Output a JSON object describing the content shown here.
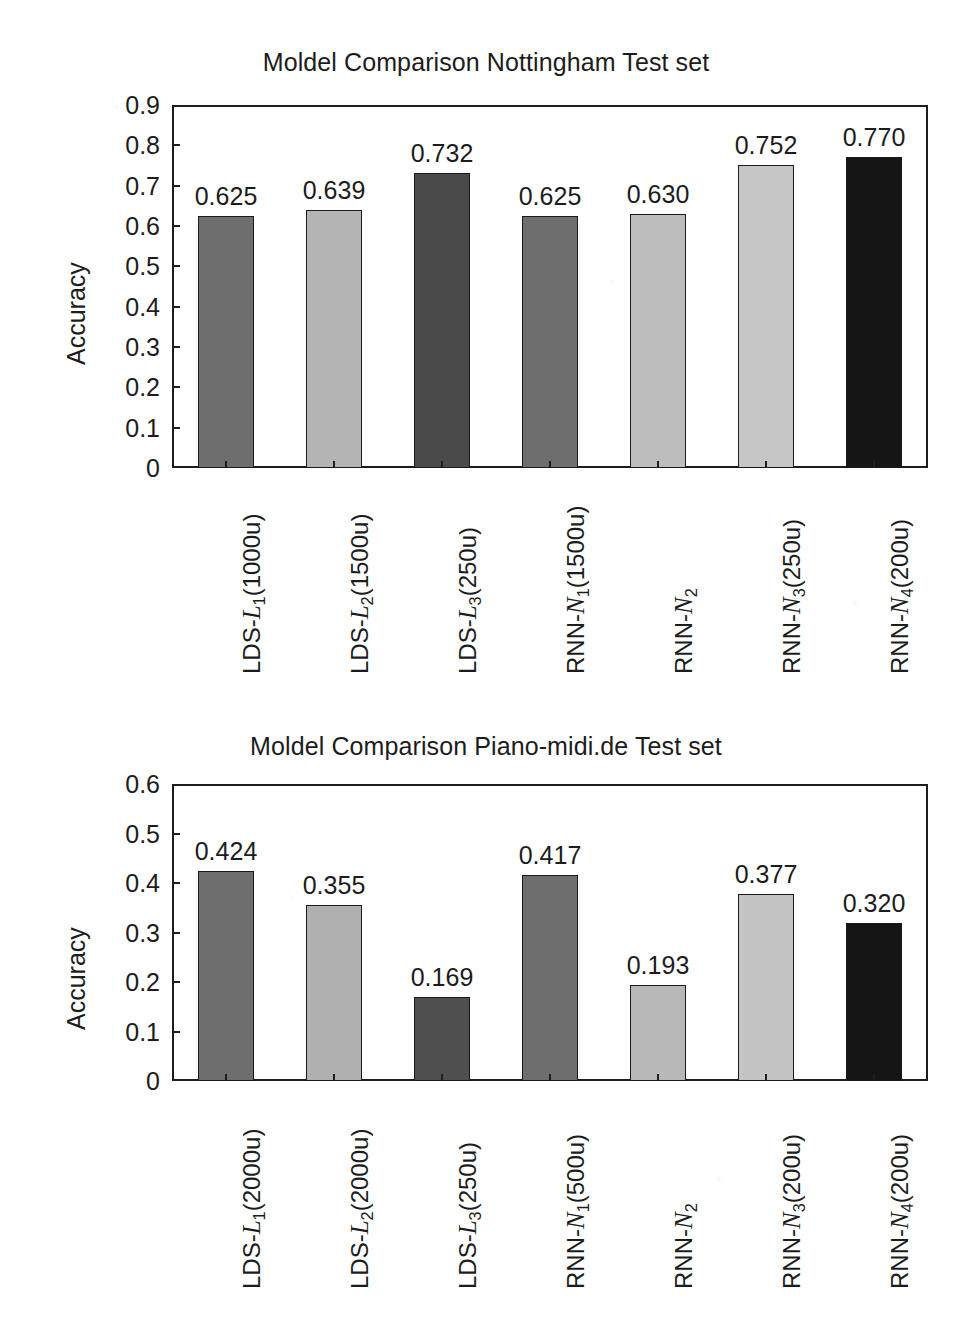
{
  "page": {
    "background_color": "#ffffff",
    "ink_color": "#1c1c1c"
  },
  "figures": [
    {
      "id": "nottingham",
      "title": "Moldel Comparison Nottingham Test set",
      "ylabel": "Accuracy"
    },
    {
      "id": "pianomidi",
      "title": "Moldel Comparison Piano-midi.de Test set",
      "ylabel": "Accuracy"
    }
  ],
  "chart_data": [
    {
      "type": "bar",
      "title": "Moldel Comparison Nottingham Test set",
      "xlabel": "",
      "ylabel": "Accuracy",
      "ylim": [
        0,
        0.9
      ],
      "grid": false,
      "legend": "none",
      "ytick_labels": [
        "0.9",
        "0.8",
        "0.7",
        "0.6",
        "0.5",
        "0.4",
        "0.3",
        "0.2",
        "0.1",
        "0"
      ],
      "ytick_values": [
        0.9,
        0.8,
        0.7,
        0.6,
        0.5,
        0.4,
        0.3,
        0.2,
        0.1,
        0
      ],
      "categories": [
        "LDS-L1(1000u)",
        "LDS-L2(1500u)",
        "LDS-L3(250u)",
        "RNN-N1(1500u)",
        "RNN-N2",
        "RNN-N3(250u)",
        "RNN-N4(200u)"
      ],
      "category_parts": [
        {
          "prefix": "LDS-",
          "symbol": "L",
          "sub": "1",
          "suffix": "(1000u)"
        },
        {
          "prefix": "LDS-",
          "symbol": "L",
          "sub": "2",
          "suffix": "(1500u)"
        },
        {
          "prefix": "LDS-",
          "symbol": "L",
          "sub": "3",
          "suffix": "(250u)"
        },
        {
          "prefix": "RNN-",
          "symbol": "N",
          "sub": "1",
          "suffix": "(1500u)"
        },
        {
          "prefix": "RNN-",
          "symbol": "N",
          "sub": "2",
          "suffix": ""
        },
        {
          "prefix": "RNN-",
          "symbol": "N",
          "sub": "3",
          "suffix": "(250u)"
        },
        {
          "prefix": "RNN-",
          "symbol": "N",
          "sub": "4",
          "suffix": "(200u)"
        }
      ],
      "values": [
        0.625,
        0.639,
        0.732,
        0.625,
        0.63,
        0.752,
        0.77
      ],
      "value_labels": [
        "0.625",
        "0.639",
        "0.732",
        "0.625",
        "0.630",
        "0.752",
        "0.770"
      ],
      "bar_colors": [
        "#6e6e6e",
        "#b4b4b4",
        "#4a4a4a",
        "#6e6e6e",
        "#bdbdbd",
        "#c6c6c6",
        "#151515"
      ]
    },
    {
      "type": "bar",
      "title": "Moldel Comparison Piano-midi.de Test set",
      "xlabel": "",
      "ylabel": "Accuracy",
      "ylim": [
        0,
        0.6
      ],
      "grid": false,
      "legend": "none",
      "ytick_labels": [
        "0.6",
        "0.5",
        "0.4",
        "0.3",
        "0.2",
        "0.1",
        "0"
      ],
      "ytick_values": [
        0.6,
        0.5,
        0.4,
        0.3,
        0.2,
        0.1,
        0
      ],
      "categories": [
        "LDS-L1(2000u)",
        "LDS-L2(2000u)",
        "LDS-L3(250u)",
        "RNN-N1(500u)",
        "RNN-N2",
        "RNN-N3(200u)",
        "RNN-N4(200u)"
      ],
      "category_parts": [
        {
          "prefix": "LDS-",
          "symbol": "L",
          "sub": "1",
          "suffix": "(2000u)"
        },
        {
          "prefix": "LDS-",
          "symbol": "L",
          "sub": "2",
          "suffix": "(2000u)"
        },
        {
          "prefix": "LDS-",
          "symbol": "L",
          "sub": "3",
          "suffix": "(250u)"
        },
        {
          "prefix": "RNN-",
          "symbol": "N",
          "sub": "1",
          "suffix": "(500u)"
        },
        {
          "prefix": "RNN-",
          "symbol": "N",
          "sub": "2",
          "suffix": ""
        },
        {
          "prefix": "RNN-",
          "symbol": "N",
          "sub": "3",
          "suffix": "(200u)"
        },
        {
          "prefix": "RNN-",
          "symbol": "N",
          "sub": "4",
          "suffix": "(200u)"
        }
      ],
      "values": [
        0.424,
        0.355,
        0.169,
        0.417,
        0.193,
        0.377,
        0.32
      ],
      "value_labels": [
        "0.424",
        "0.355",
        "0.169",
        "0.417",
        "0.193",
        "0.377",
        "0.320"
      ],
      "bar_colors": [
        "#6e6e6e",
        "#b0b0b0",
        "#4f4f4f",
        "#6e6e6e",
        "#b8b8b8",
        "#c4c4c4",
        "#151515"
      ]
    }
  ]
}
